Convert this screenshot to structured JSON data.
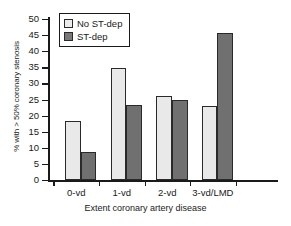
{
  "chart_data": {
    "type": "bar",
    "title": "",
    "xlabel": "Extent coronary artery disease",
    "ylabel": "% with > 50% coronary stenosis",
    "categories": [
      "0-vd",
      "1-vd",
      "2-vd",
      "3-vd/LMD"
    ],
    "series": [
      {
        "name": "No ST-dep",
        "values": [
          18.3,
          34.8,
          26.0,
          23.1
        ],
        "color": "#e9e9e9"
      },
      {
        "name": "ST-dep",
        "values": [
          8.7,
          23.4,
          24.7,
          45.6
        ],
        "color": "#707070"
      }
    ],
    "ylim": [
      0,
      50
    ],
    "ytick_labels": [
      "50",
      "45",
      "40",
      "35",
      "30",
      "25",
      "20",
      "15",
      "10",
      "5",
      "0"
    ],
    "ytick_values": [
      50,
      45,
      40,
      35,
      30,
      25,
      20,
      15,
      10,
      5,
      0
    ],
    "grid": false,
    "legend_position": "top-left"
  }
}
